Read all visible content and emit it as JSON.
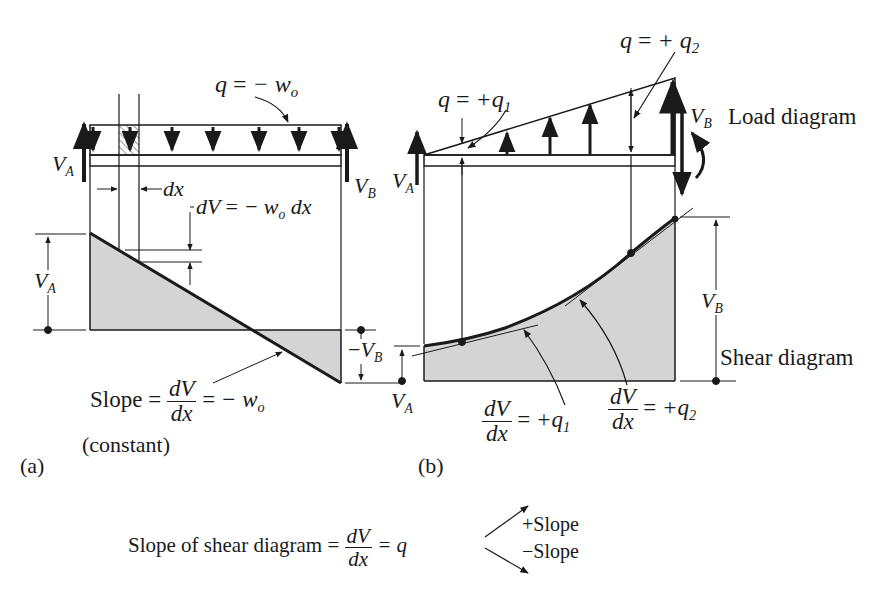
{
  "figure": {
    "panel_a": {
      "tag": "(a)",
      "load_label": {
        "lhs": "q",
        "eq": "=",
        "rhs": "− w",
        "rhs_sub": "o"
      },
      "dx_label": "dx",
      "dV_label": {
        "lhs": "dV",
        "eq": "=",
        "rhs": "− w",
        "rhs_sub": "o",
        "tail": "dx"
      },
      "reaction_left": {
        "v": "V",
        "sub": "A"
      },
      "reaction_right": {
        "v": "V",
        "sub": "B"
      },
      "shear_left_dim": {
        "v": "V",
        "sub": "A"
      },
      "shear_right_dim": {
        "prefix": "−",
        "v": "V",
        "sub": "B"
      },
      "slope_label": {
        "word": "Slope",
        "eq": "=",
        "num": "dV",
        "den": "dx",
        "eq2": "=",
        "rhs": "− w",
        "rhs_sub": "o"
      },
      "constant_note": "(constant)"
    },
    "panel_b": {
      "tag": "(b)",
      "load_label_1": {
        "lhs": "q",
        "eq": "=",
        "rhs": "+q",
        "rhs_sub": "1"
      },
      "load_label_2": {
        "lhs": "q",
        "eq": "=",
        "rhs": "+ q",
        "rhs_sub": "2"
      },
      "reaction_left": {
        "v": "V",
        "sub": "A"
      },
      "reaction_right": {
        "v": "V",
        "sub": "B"
      },
      "load_diagram_title": "Load diagram",
      "shear_diagram_title": "Shear diagram",
      "shear_left_dim": {
        "v": "V",
        "sub": "A"
      },
      "shear_right_dim": {
        "v": "V",
        "sub": "B"
      },
      "slope_1": {
        "num": "dV",
        "den": "dx",
        "eq": "=",
        "rhs": "+q",
        "rhs_sub": "1"
      },
      "slope_2": {
        "num": "dV",
        "den": "dx",
        "eq": "=",
        "rhs": "+q",
        "rhs_sub": "2"
      }
    },
    "summary": {
      "prefix": "Slope of shear diagram =",
      "num": "dV",
      "den": "dx",
      "eq": "= q",
      "plus": "+Slope",
      "minus": "−Slope"
    },
    "colors": {
      "ink": "#1a1a1a",
      "fill": "#d4d4d4"
    }
  }
}
